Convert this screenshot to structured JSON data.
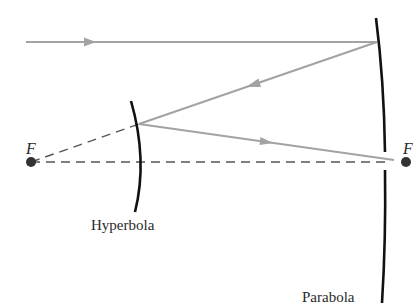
{
  "diagram": {
    "labels": {
      "focus_left": "F",
      "focus_right": "F",
      "hyperbola": "Hyperbola",
      "parabola": "Parabola"
    },
    "colors": {
      "ray": "#a3a3a3",
      "mirror": "#111111",
      "dashed": "#555555",
      "focus_dot": "#333333",
      "text": "#2a2a2a"
    },
    "elements": [
      {
        "type": "incoming-ray",
        "from": [
          26,
          42
        ],
        "to": [
          377,
          42
        ],
        "arrow_at": [
          90,
          42
        ]
      },
      {
        "type": "reflected-ray",
        "from": [
          377,
          42
        ],
        "to": [
          139,
          124
        ],
        "arrow_at": [
          252,
          85
        ]
      },
      {
        "type": "final-ray",
        "from": [
          139,
          124
        ],
        "to": [
          394,
          160
        ],
        "arrow_at": [
          266,
          142
        ]
      },
      {
        "type": "dashed-line",
        "from": [
          31,
          162
        ],
        "to": [
          139,
          124
        ]
      },
      {
        "type": "dashed-axis",
        "from": [
          31,
          162
        ],
        "to": [
          386,
          162
        ]
      },
      {
        "type": "focus",
        "position": [
          31,
          162
        ]
      },
      {
        "type": "focus",
        "position": [
          406,
          162
        ]
      }
    ]
  }
}
